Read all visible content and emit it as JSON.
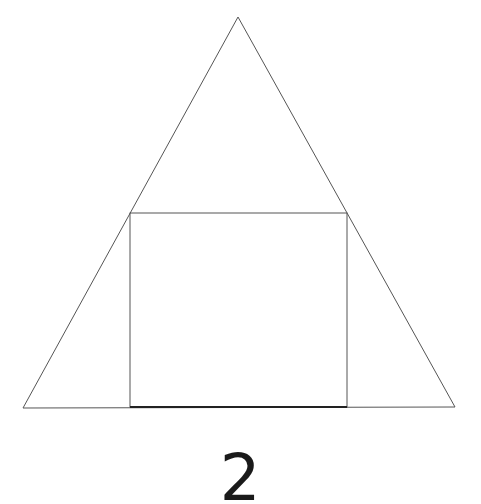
{
  "figure": {
    "label": "2",
    "colors": {
      "background": "#ffffff",
      "triangle_stroke": "#555555",
      "square_stroke": "#555555",
      "square_bottom_stroke": "#222222",
      "label": "#1a1a1a"
    },
    "triangle": {
      "apex": [
        238,
        17
      ],
      "bottom_left": [
        23,
        408
      ],
      "bottom_right": [
        455,
        407
      ]
    },
    "square": {
      "top_left": [
        130,
        213
      ],
      "top_right": [
        347,
        213
      ],
      "bottom_right": [
        347,
        407
      ],
      "bottom_left": [
        130,
        407
      ]
    }
  }
}
